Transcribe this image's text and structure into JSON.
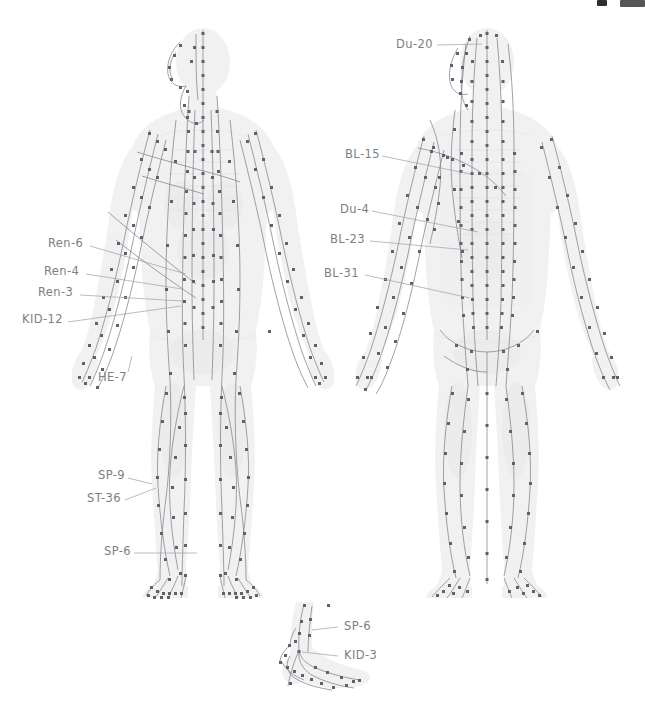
{
  "document": {
    "kind": "acupuncture-meridian-chart",
    "background_color": "#ffffff",
    "label_color": "#7b7f86",
    "point_color": "#5d626b",
    "meridian_color": "#7e838c",
    "body_fill_color": "#f1f1f1"
  },
  "top_bar": {
    "chip_a": "",
    "chip_b": ""
  },
  "figures": [
    {
      "id": "front-figure",
      "view": "anterior",
      "x": 95,
      "y": 28,
      "width": 185,
      "height": 580
    },
    {
      "id": "back-figure",
      "view": "posterior",
      "x": 390,
      "y": 28,
      "width": 195,
      "height": 580
    },
    {
      "id": "foot-inset-figure",
      "view": "medial-foot",
      "x": 278,
      "y": 600,
      "width": 95,
      "height": 95
    }
  ],
  "labels": {
    "front": [
      {
        "text": "Ren-6",
        "x": 48,
        "y": 239,
        "leader_to_x": 186,
        "leader_to_y": 274
      },
      {
        "text": "Ren-4",
        "x": 44,
        "y": 268,
        "leader_to_x": 182,
        "leader_to_y": 289
      },
      {
        "text": "Ren-3",
        "x": 38,
        "y": 289,
        "leader_to_x": 182,
        "leader_to_y": 301
      },
      {
        "text": "KID-12",
        "x": 22,
        "y": 317,
        "leader_to_x": 181,
        "leader_to_y": 306
      },
      {
        "text": "HE-7",
        "x": 98,
        "y": 374,
        "leader_to_x": 132,
        "leader_to_y": 352
      },
      {
        "text": "SP-9",
        "x": 98,
        "y": 472,
        "leader_to_x": 152,
        "leader_to_y": 484
      },
      {
        "text": "ST-36",
        "x": 87,
        "y": 496,
        "leader_to_x": 156,
        "leader_to_y": 488
      },
      {
        "text": "SP-6",
        "x": 104,
        "y": 548,
        "leader_to_x": 197,
        "leader_to_y": 552
      }
    ],
    "back": [
      {
        "text": "Du-20",
        "x": 396,
        "y": 41,
        "leader_to_x": 480,
        "leader_to_y": 40
      },
      {
        "text": "BL-15",
        "x": 345,
        "y": 151,
        "leader_to_x": 470,
        "leader_to_y": 172
      },
      {
        "text": "Du-4",
        "x": 340,
        "y": 206,
        "leader_to_x": 478,
        "leader_to_y": 230
      },
      {
        "text": "BL-23",
        "x": 330,
        "y": 235,
        "leader_to_x": 468,
        "leader_to_y": 248
      },
      {
        "text": "BL-31",
        "x": 324,
        "y": 269,
        "leader_to_x": 470,
        "leader_to_y": 296
      }
    ],
    "foot_inset": [
      {
        "text": "SP-6",
        "x": 344,
        "y": 622,
        "leader_to_x": 318,
        "leader_to_y": 628
      },
      {
        "text": "KID-3",
        "x": 344,
        "y": 651,
        "leader_to_x": 316,
        "leader_to_y": 657
      }
    ]
  },
  "legend_points": {
    "front_points_visible": true,
    "back_points_visible": true,
    "inset_points_visible": true
  }
}
